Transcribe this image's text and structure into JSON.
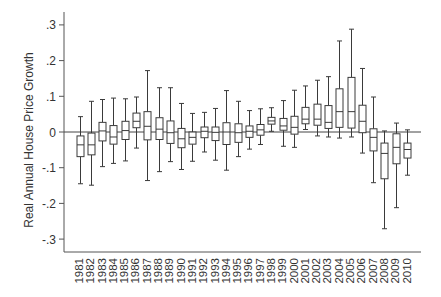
{
  "chart_data": {
    "type": "box",
    "title": "",
    "xlabel": "",
    "ylabel": "Real Annual House Price Growth",
    "ylim": [
      -0.336,
      0.336
    ],
    "yticks": [
      0.3,
      0.2,
      0.1,
      0,
      -0.1,
      -0.2,
      -0.3
    ],
    "ytick_labels": [
      ".3",
      ".2",
      ".1",
      "0",
      "-.1",
      "-.2",
      "-.3"
    ],
    "reference_line": 0,
    "grid": false,
    "legend": null,
    "categories": [
      "1981",
      "1982",
      "1983",
      "1984",
      "1985",
      "1986",
      "1987",
      "1988",
      "1989",
      "1990",
      "1991",
      "1992",
      "1993",
      "1994",
      "1995",
      "1996",
      "1997",
      "1998",
      "1999",
      "2000",
      "2001",
      "2002",
      "2003",
      "2004",
      "2005",
      "2006",
      "2007",
      "2008",
      "2009",
      "2010"
    ],
    "boxes": [
      {
        "whisker_low": -0.145,
        "q1": -0.069,
        "median": -0.036,
        "q3": -0.011,
        "whisker_high": 0.043
      },
      {
        "whisker_low": -0.149,
        "q1": -0.064,
        "median": -0.036,
        "q3": -0.003,
        "whisker_high": 0.086
      },
      {
        "whisker_low": -0.097,
        "q1": -0.025,
        "median": 0.003,
        "q3": 0.027,
        "whisker_high": 0.091
      },
      {
        "whisker_low": -0.088,
        "q1": -0.034,
        "median": -0.014,
        "q3": 0.018,
        "whisker_high": 0.095
      },
      {
        "whisker_low": -0.081,
        "q1": -0.021,
        "median": 0.004,
        "q3": 0.03,
        "whisker_high": 0.093
      },
      {
        "whisker_low": -0.045,
        "q1": 0.012,
        "median": 0.03,
        "q3": 0.053,
        "whisker_high": 0.098
      },
      {
        "whisker_low": -0.136,
        "q1": -0.022,
        "median": 0.016,
        "q3": 0.057,
        "whisker_high": 0.172
      },
      {
        "whisker_low": -0.111,
        "q1": -0.021,
        "median": 0.008,
        "q3": 0.04,
        "whisker_high": 0.124
      },
      {
        "whisker_low": -0.083,
        "q1": -0.032,
        "median": -0.002,
        "q3": 0.031,
        "whisker_high": 0.124
      },
      {
        "whisker_low": -0.105,
        "q1": -0.044,
        "median": -0.019,
        "q3": 0.01,
        "whisker_high": 0.08
      },
      {
        "whisker_low": -0.082,
        "q1": -0.034,
        "median": -0.015,
        "q3": 0.0,
        "whisker_high": 0.052
      },
      {
        "whisker_low": -0.056,
        "q1": -0.016,
        "median": 0.002,
        "q3": 0.014,
        "whisker_high": 0.055
      },
      {
        "whisker_low": -0.079,
        "q1": -0.024,
        "median": -0.001,
        "q3": 0.014,
        "whisker_high": 0.066
      },
      {
        "whisker_low": -0.107,
        "q1": -0.035,
        "median": 0.0,
        "q3": 0.026,
        "whisker_high": 0.116
      },
      {
        "whisker_low": -0.069,
        "q1": -0.029,
        "median": -0.002,
        "q3": 0.023,
        "whisker_high": 0.086
      },
      {
        "whisker_low": -0.048,
        "q1": -0.015,
        "median": 0.002,
        "q3": 0.017,
        "whisker_high": 0.06
      },
      {
        "whisker_low": -0.035,
        "q1": -0.009,
        "median": 0.006,
        "q3": 0.021,
        "whisker_high": 0.065
      },
      {
        "whisker_low": 0.002,
        "q1": 0.022,
        "median": 0.031,
        "q3": 0.041,
        "whisker_high": 0.068
      },
      {
        "whisker_low": -0.04,
        "q1": 0.005,
        "median": 0.017,
        "q3": 0.038,
        "whisker_high": 0.088
      },
      {
        "whisker_low": -0.043,
        "q1": -0.006,
        "median": 0.013,
        "q3": 0.044,
        "whisker_high": 0.117
      },
      {
        "whisker_low": 0.007,
        "q1": 0.023,
        "median": 0.036,
        "q3": 0.069,
        "whisker_high": 0.129
      },
      {
        "whisker_low": -0.011,
        "q1": 0.019,
        "median": 0.036,
        "q3": 0.078,
        "whisker_high": 0.145
      },
      {
        "whisker_low": -0.014,
        "q1": 0.01,
        "median": 0.027,
        "q3": 0.074,
        "whisker_high": 0.155
      },
      {
        "whisker_low": -0.017,
        "q1": 0.013,
        "median": 0.057,
        "q3": 0.121,
        "whisker_high": 0.255
      },
      {
        "whisker_low": -0.014,
        "q1": 0.011,
        "median": 0.057,
        "q3": 0.153,
        "whisker_high": 0.288
      },
      {
        "whisker_low": -0.059,
        "q1": -0.002,
        "median": 0.03,
        "q3": 0.075,
        "whisker_high": 0.178
      },
      {
        "whisker_low": -0.142,
        "q1": -0.053,
        "median": -0.015,
        "q3": 0.009,
        "whisker_high": 0.098
      },
      {
        "whisker_low": -0.271,
        "q1": -0.131,
        "median": -0.06,
        "q3": -0.031,
        "whisker_high": 0.003
      },
      {
        "whisker_low": -0.212,
        "q1": -0.089,
        "median": -0.043,
        "q3": -0.005,
        "whisker_high": 0.025
      },
      {
        "whisker_low": -0.121,
        "q1": -0.073,
        "median": -0.049,
        "q3": -0.031,
        "whisker_high": 0.006
      }
    ],
    "colors": {
      "box_stroke": "#3a3a3a",
      "axis": "#555555",
      "text": "#333333",
      "background": "#ffffff"
    }
  }
}
